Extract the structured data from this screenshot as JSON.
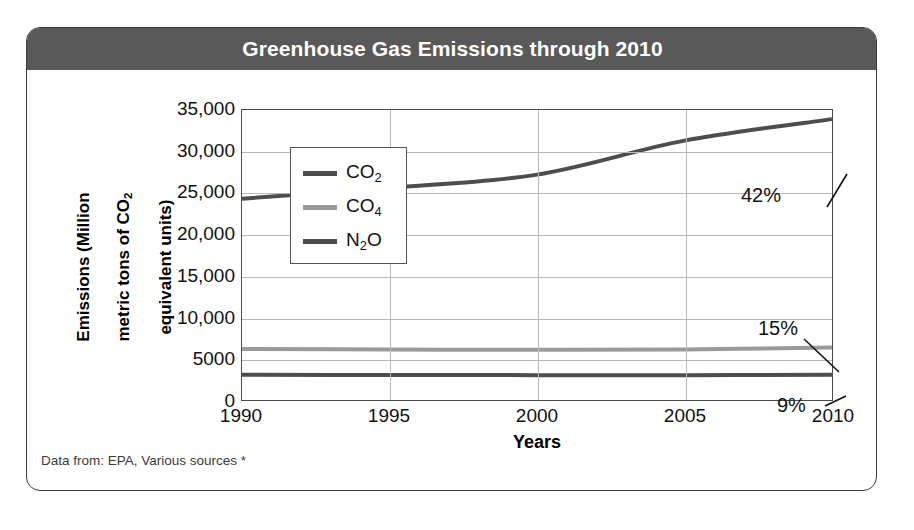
{
  "chart_data": {
    "type": "line",
    "title": "Greenhouse Gas Emissions through 2010",
    "xlabel": "Years",
    "ylabel": "Emissions (Million metric tons of CO₂ equivalent units)",
    "ylabel_line1": "Emissions (Million",
    "ylabel_line2_pre": "metric tons of CO",
    "ylabel_line2_sub": "2",
    "ylabel_line3": "equivalent units)",
    "x": [
      1990,
      1995,
      2000,
      2005,
      2010
    ],
    "xlim": [
      1990,
      2010
    ],
    "ylim": [
      0,
      35000
    ],
    "grid": true,
    "legend_position": "center-left-inside",
    "xtick_labels": [
      "1990",
      "1995",
      "2000",
      "2005",
      "2010"
    ],
    "ytick_values": [
      0,
      5000,
      10000,
      15000,
      20000,
      25000,
      30000,
      35000
    ],
    "ytick_labels": [
      "0",
      "5000",
      "10,000",
      "15,000",
      "20,000",
      "25,000",
      "30,000",
      "35,000"
    ],
    "series": [
      {
        "name": "CO2",
        "legend_label_base": "CO",
        "legend_label_sub": "2",
        "color": "#4d4d4d",
        "values": [
          24300,
          25600,
          27200,
          31300,
          33900
        ]
      },
      {
        "name": "CO4",
        "legend_label_base": "CO",
        "legend_label_sub": "4",
        "color": "#9a9a9a",
        "values": [
          6150,
          6100,
          6050,
          6100,
          6350
        ]
      },
      {
        "name": "N2O",
        "legend_label_base": "N",
        "legend_label_sub": "2",
        "legend_label_post": "O",
        "color": "#4d4d4d",
        "values": [
          3050,
          3020,
          3000,
          2990,
          3050
        ]
      }
    ],
    "annotations": [
      {
        "text": "42%",
        "series": "CO2",
        "at_x": 2010
      },
      {
        "text": "15%",
        "series": "CO4",
        "at_x": 2010
      },
      {
        "text": "9%",
        "series": "N2O",
        "at_x": 2010
      }
    ]
  },
  "legend": {
    "items": [
      {
        "base": "CO",
        "sub": "2",
        "post": "",
        "color": "#4d4d4d"
      },
      {
        "base": "CO",
        "sub": "4",
        "post": "",
        "color": "#9a9a9a"
      },
      {
        "base": "N",
        "sub": "2",
        "post": "O",
        "color": "#4d4d4d"
      }
    ]
  },
  "footer": {
    "source_note": "Data from: EPA, Various sources *"
  },
  "colors": {
    "title_bar": "#595959",
    "title_text": "#ffffff",
    "card_border": "#3c3c3c",
    "gridline": "#b9b9b9",
    "axis": "#4a4a4a"
  }
}
